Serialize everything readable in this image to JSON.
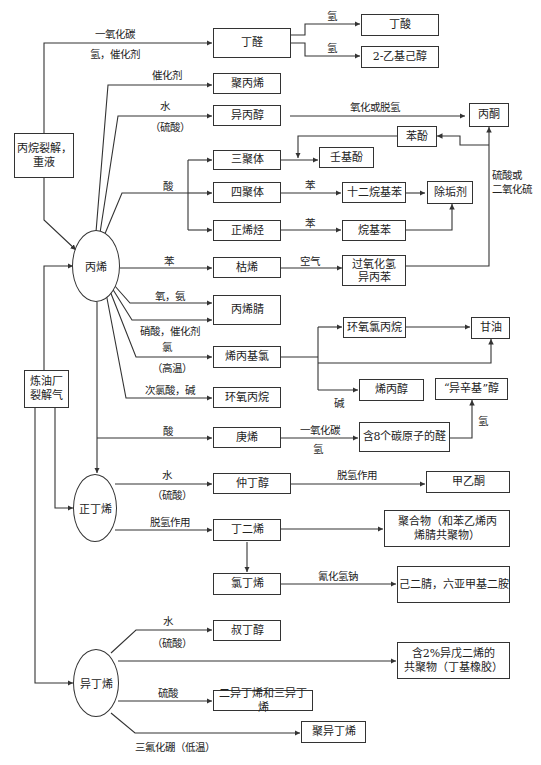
{
  "sources": {
    "propane_cracking": "丙烷裂解，\n重液",
    "refinery_gas": "炼油厂\n裂解气"
  },
  "feedstocks": {
    "propylene": "丙烯",
    "n_butene": "正丁烯",
    "isobutene": "异丁烯"
  },
  "products": {
    "butyraldehyde": "丁醛",
    "butyric_acid": "丁酸",
    "ethylhexanol": "2-乙基己醇",
    "polypropylene": "聚丙烯",
    "isopropanol": "异丙醇",
    "acetone": "丙酮",
    "phenol": "苯酚",
    "trimer": "三聚体",
    "nonylphenol": "壬基酚",
    "tetramer": "四聚体",
    "dodecylbenzene": "十二烷基苯",
    "detergent": "除垢剂",
    "n_olefin": "正烯烃",
    "alkylbenzene": "烷基苯",
    "cumene": "枯烯",
    "cumene_hydroperoxide": "过氧化氢\n异丙苯",
    "acrylonitrile": "丙烯腈",
    "allyl_chloride": "烯丙基氯",
    "epichlorohydrin": "环氧氯丙烷",
    "glycerol": "甘油",
    "allyl_alcohol": "烯丙醇",
    "isooctyl_alcohol": "“异辛基”醇",
    "propylene_oxide": "环氧丙烷",
    "heptene": "庚烯",
    "c8_aldehyde": "含8个碳原子的醛",
    "sec_butanol": "仲丁醇",
    "mek": "甲乙酮",
    "butadiene": "丁二烯",
    "polymer": "聚合物（和苯乙烯丙\n烯腈共聚物）",
    "chloroprene": "氯丁烯",
    "adiponitrile": "己二腈，六亚甲基二胺",
    "tert_butanol": "叔丁醇",
    "butyl_rubber": "含2%异戊二烯的\n共聚物（丁基橡胶）",
    "di_tri_isobutene": "二异丁烯和三异丁烯",
    "polyisobutene": "聚异丁烯"
  },
  "labels": {
    "co": "一氧化碳",
    "h2_catalyst": "氢，催化剂",
    "h2_a": "氢",
    "h2_b": "氢",
    "catalyst": "催化剂",
    "water": "水",
    "sulfuric_paren": "（硫酸）",
    "oxidation": "氧化或脱氢",
    "sulfuric_or_so2": "硫酸或\n二氧化硫",
    "acid": "酸",
    "benzene_a": "苯",
    "benzene_b": "苯",
    "benzene_c": "苯",
    "air": "空气",
    "oxygen_ammonia": "氧，氨",
    "nitric_catalyst": "硝酸，催化剂",
    "chlorine": "氯",
    "high_temp": "（高温）",
    "hypochlorous": "次氯酸，碱",
    "alkali": "碱",
    "acid_heptene": "酸",
    "co_b": "一氧化碳",
    "h2_c": "氢",
    "h2_d": "氢",
    "water_b": "水",
    "sulfuric_paren_b": "（硫酸）",
    "dehydrogenation_a": "脱氢作用",
    "dehydrogenation_b": "脱氢作用",
    "sodium_cyanide": "氰化氢钠",
    "water_c": "水",
    "sulfuric_paren_c": "（硫酸）",
    "sulfuric": "硫酸",
    "bf3": "三氟化硼（低温）"
  }
}
